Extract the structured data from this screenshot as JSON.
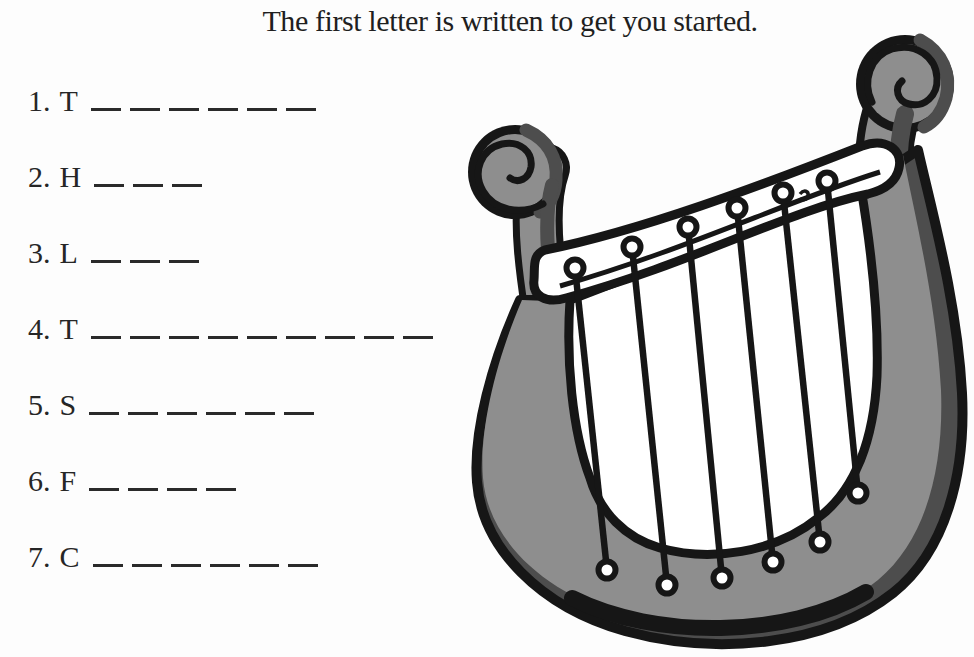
{
  "title": "The first letter is written to get you started.",
  "worksheet": {
    "items": [
      {
        "number": "1.",
        "letter": "T",
        "blanks": 6
      },
      {
        "number": "2.",
        "letter": "H",
        "blanks": 3
      },
      {
        "number": "3.",
        "letter": "L",
        "blanks": 3
      },
      {
        "number": "4.",
        "letter": "T",
        "blanks": 9
      },
      {
        "number": "5.",
        "letter": "S",
        "blanks": 6
      },
      {
        "number": "6.",
        "letter": "F",
        "blanks": 4
      },
      {
        "number": "7.",
        "letter": "C",
        "blanks": 6
      }
    ]
  },
  "illustration": {
    "name": "lyre",
    "string_count": 6,
    "peg_count": 6,
    "colors": {
      "body": "#8e8e8e",
      "shade": "#4d4d4d",
      "outline": "#161616",
      "yoke": "#ffffff"
    }
  },
  "page": {
    "background": "#fdfdfd",
    "ink": "#262626"
  }
}
